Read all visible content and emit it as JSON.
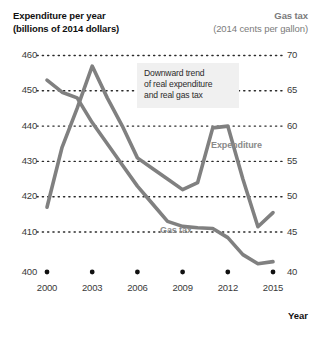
{
  "header": {
    "left_title": "Expenditure per year",
    "left_subtitle": "(billions of 2014 dollars)",
    "right_title": "Gas tax",
    "right_subtitle": "(2014 cents per gallon)"
  },
  "callout": {
    "line1": "Downward trend",
    "line2": "of real expenditure",
    "line3": "and real gas tax",
    "text": "Downward trend of real expenditure and real gas tax",
    "background": "#f0f0f0"
  },
  "series_labels": {
    "expenditure": "Expenditure",
    "gas_tax": "Gas tax"
  },
  "axis_titles": {
    "x": "Year"
  },
  "colors": {
    "line": "#808080",
    "gridline": "#2b2b2b",
    "tick_text": "#3a3a3a",
    "right_header": "#7b7b7b",
    "series_label": "#8a8a8a"
  },
  "chart_data": {
    "type": "line",
    "xlabel": "Year",
    "ylabel": "Expenditure per year (billions of 2014 dollars)",
    "y2label": "Gas tax (2014 cents per gallon)",
    "grid": true,
    "legend": "inline-annotation",
    "xlim": [
      2000,
      2015
    ],
    "ylim": [
      400,
      460
    ],
    "y2lim": [
      40,
      70
    ],
    "xticks": [
      2000,
      2003,
      2006,
      2009,
      2012,
      2015
    ],
    "xtick_labels": [
      "2000",
      "2003",
      "2006",
      "2009",
      "2012",
      "2015"
    ],
    "yticks": [
      400,
      410,
      420,
      430,
      440,
      450,
      460
    ],
    "ytick_labels": [
      "400",
      "410",
      "420",
      "430",
      "440",
      "450",
      "460"
    ],
    "y2ticks": [
      40,
      45,
      50,
      55,
      60,
      65,
      70
    ],
    "y2tick_labels": [
      "40",
      "45",
      "50",
      "55",
      "60",
      "65",
      "70"
    ],
    "x": [
      2000,
      2001,
      2002,
      2003,
      2004,
      2005,
      2006,
      2007,
      2008,
      2009,
      2010,
      2011,
      2012,
      2013,
      2014,
      2015
    ],
    "series": [
      {
        "name": "Expenditure",
        "axis": "left",
        "units": "billions of 2014 dollars",
        "values": [
          417.0,
          434.0,
          445.0,
          457.0,
          448.0,
          440.0,
          431.0,
          428.0,
          425.0,
          422.0,
          424.0,
          439.5,
          440.0,
          425.0,
          411.5,
          415.5
        ]
      },
      {
        "name": "Gas tax",
        "axis": "right",
        "units": "2014 cents per gallon",
        "values": [
          66.5,
          64.8,
          64.0,
          60.5,
          57.5,
          54.5,
          51.5,
          49.0,
          46.5,
          45.8,
          45.6,
          45.5,
          44.2,
          41.8,
          40.5,
          40.8
        ]
      }
    ],
    "annotations": [
      {
        "text": "Downward trend of real expenditure and real gas tax",
        "x": 2004.5,
        "y": 448
      }
    ]
  }
}
